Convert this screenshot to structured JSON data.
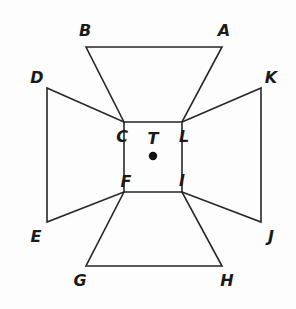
{
  "figure": {
    "name": "four-trapezoid-cross-diagram",
    "background_color": "#fdfdfd",
    "stroke_color": "#262626",
    "stroke_width": 1.6,
    "width": 296,
    "height": 309,
    "center_point": {
      "label": "T",
      "x": 153,
      "y": 156,
      "dot_radius": 4.2,
      "dot_color": "#111111"
    },
    "vertices": [
      {
        "label": "A",
        "x": 222,
        "y": 47,
        "label_x": 224,
        "label_y": 31
      },
      {
        "label": "B",
        "x": 86,
        "y": 47,
        "label_x": 85,
        "label_y": 31
      },
      {
        "label": "C",
        "x": 124,
        "y": 122,
        "label_x": 122,
        "label_y": 137
      },
      {
        "label": "D",
        "x": 47,
        "y": 88,
        "label_x": 37,
        "label_y": 78
      },
      {
        "label": "E",
        "x": 47,
        "y": 222,
        "label_x": 36,
        "label_y": 237
      },
      {
        "label": "F",
        "x": 124,
        "y": 192,
        "label_x": 126,
        "label_y": 182
      },
      {
        "label": "G",
        "x": 86,
        "y": 266,
        "label_x": 80,
        "label_y": 281
      },
      {
        "label": "H",
        "x": 222,
        "y": 266,
        "label_x": 227,
        "label_y": 281
      },
      {
        "label": "I",
        "x": 182,
        "y": 192,
        "label_x": 182,
        "label_y": 181
      },
      {
        "label": "J",
        "x": 261,
        "y": 222,
        "label_x": 271,
        "label_y": 237
      },
      {
        "label": "K",
        "x": 261,
        "y": 88,
        "label_x": 271,
        "label_y": 78
      },
      {
        "label": "L",
        "x": 182,
        "y": 122,
        "label_x": 184,
        "label_y": 137
      }
    ],
    "shapes": [
      {
        "name": "top-trapezoid",
        "vertex_labels": [
          "B",
          "A",
          "L",
          "C"
        ],
        "path": "M 86 47 L 222 47 L 182 122 L 124 122 Z"
      },
      {
        "name": "left-trapezoid",
        "vertex_labels": [
          "D",
          "C",
          "F",
          "E"
        ],
        "path": "M 47 88 L 124 122 L 124 192 L 47 222 Z"
      },
      {
        "name": "right-trapezoid",
        "vertex_labels": [
          "K",
          "J",
          "I",
          "L"
        ],
        "path": "M 261 88 L 261 222 L 182 192 L 182 122 Z"
      },
      {
        "name": "bottom-trapezoid",
        "vertex_labels": [
          "F",
          "I",
          "H",
          "G"
        ],
        "path": "M 124 192 L 182 192 L 222 266 L 86 266 Z"
      }
    ]
  }
}
